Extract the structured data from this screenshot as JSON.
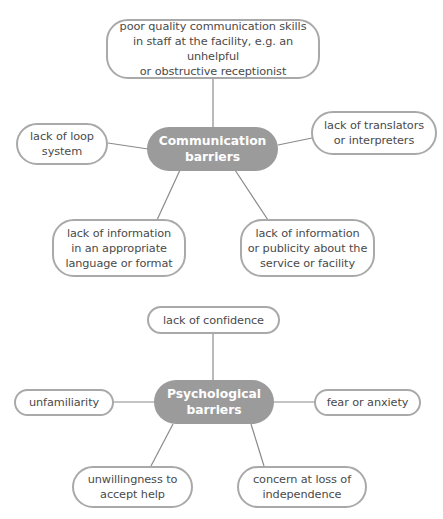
{
  "diagrams": [
    {
      "hub": {
        "label": "Communication\nbarriers"
      },
      "nodes": [
        {
          "label": "poor quality communication skills\nin staff at the facility, e.g. an unhelpful\nor obstructive receptionist"
        },
        {
          "label": "lack of loop\nsystem"
        },
        {
          "label": "lack of translators\nor interpreters"
        },
        {
          "label": "lack of information\nin an appropriate\nlanguage or format"
        },
        {
          "label": "lack of information\nor publicity about the\nservice or facility"
        }
      ]
    },
    {
      "hub": {
        "label": "Psychological\nbarriers"
      },
      "nodes": [
        {
          "label": "lack of confidence"
        },
        {
          "label": "unfamiliarity"
        },
        {
          "label": "fear or anxiety"
        },
        {
          "label": "unwillingness to\naccept help"
        },
        {
          "label": "concern at loss of\nindependence"
        }
      ]
    }
  ],
  "colors": {
    "hub_fill": "#9b9b9b",
    "node_border": "#a9a9a9",
    "connector": "#8a8a8a",
    "text": "#4a4a4a"
  }
}
